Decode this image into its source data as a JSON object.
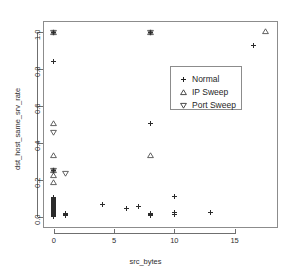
{
  "chart_data": {
    "type": "scatter",
    "title": "",
    "xlabel": "src_bytes",
    "ylabel": "dst_host_same_srv_rate",
    "xlim": [
      -0.9,
      18.6
    ],
    "ylim": [
      -0.06,
      1.06
    ],
    "xticks": [
      0,
      5,
      10,
      15
    ],
    "xticklabels": [
      "0",
      "5",
      "10",
      "15"
    ],
    "yticks": [
      0.0,
      0.2,
      0.4,
      0.6,
      0.8,
      1.0
    ],
    "yticklabels": [
      "0.0",
      "0.2",
      "0.4",
      "0.6",
      "0.8",
      "1.0"
    ],
    "grid": false,
    "legend_position": "center-right",
    "series": [
      {
        "name": "Normal",
        "marker": "plus",
        "color": "#2b2b2b",
        "points": [
          [
            0,
            1.0
          ],
          [
            0,
            1.0
          ],
          [
            0,
            1.0
          ],
          [
            0,
            0.84
          ],
          [
            0,
            0.25
          ],
          [
            0,
            0.25
          ],
          [
            0,
            0.105
          ],
          [
            0,
            0.1
          ],
          [
            0,
            0.095
          ],
          [
            0,
            0.09
          ],
          [
            0,
            0.088
          ],
          [
            0,
            0.085
          ],
          [
            0,
            0.082
          ],
          [
            0,
            0.08
          ],
          [
            0,
            0.078
          ],
          [
            0,
            0.075
          ],
          [
            0,
            0.072
          ],
          [
            0,
            0.07
          ],
          [
            0,
            0.068
          ],
          [
            0,
            0.065
          ],
          [
            0,
            0.062
          ],
          [
            0,
            0.06
          ],
          [
            0,
            0.058
          ],
          [
            0,
            0.055
          ],
          [
            0,
            0.052
          ],
          [
            0,
            0.05
          ],
          [
            0,
            0.048
          ],
          [
            0,
            0.045
          ],
          [
            0,
            0.042
          ],
          [
            0,
            0.04
          ],
          [
            0,
            0.038
          ],
          [
            0,
            0.035
          ],
          [
            0,
            0.032
          ],
          [
            0,
            0.03
          ],
          [
            0,
            0.028
          ],
          [
            0,
            0.025
          ],
          [
            0,
            0.022
          ],
          [
            0,
            0.02
          ],
          [
            0,
            0.018
          ],
          [
            0,
            0.015
          ],
          [
            0,
            0.012
          ],
          [
            0,
            0.01
          ],
          [
            0,
            0.008
          ],
          [
            0,
            0.005
          ],
          [
            0,
            0.003
          ],
          [
            0,
            0.0
          ],
          [
            1,
            0.02
          ],
          [
            1,
            0.015
          ],
          [
            1,
            0.012
          ],
          [
            1,
            0.01
          ],
          [
            1,
            0.008
          ],
          [
            1,
            0.005
          ],
          [
            4,
            0.065
          ],
          [
            6,
            0.045
          ],
          [
            7,
            0.055
          ],
          [
            8,
            1.0
          ],
          [
            8,
            1.0
          ],
          [
            8,
            0.505
          ],
          [
            8,
            0.02
          ],
          [
            8,
            0.015
          ],
          [
            8,
            0.012
          ],
          [
            8,
            0.01
          ],
          [
            8,
            0.008
          ],
          [
            10,
            0.11
          ],
          [
            10,
            0.025
          ],
          [
            10,
            0.015
          ],
          [
            13,
            0.025
          ],
          [
            16.6,
            0.93
          ]
        ]
      },
      {
        "name": "IP Sweep",
        "marker": "triangle-up",
        "color": "#3a3a3a",
        "points": [
          [
            0,
            1.0
          ],
          [
            0,
            0.505
          ],
          [
            0,
            0.335
          ],
          [
            0,
            0.25
          ],
          [
            0,
            0.225
          ],
          [
            0,
            0.185
          ],
          [
            8,
            1.0
          ],
          [
            8,
            0.335
          ],
          [
            17.6,
            1.005
          ]
        ]
      },
      {
        "name": "Port Sweep",
        "marker": "triangle-down",
        "color": "#3a3a3a",
        "points": [
          [
            0,
            1.0
          ],
          [
            0,
            0.455
          ],
          [
            0,
            0.25
          ],
          [
            1,
            0.235
          ],
          [
            8,
            1.0
          ]
        ]
      }
    ]
  },
  "legend": {
    "entries": [
      {
        "label": "Normal",
        "marker": "plus"
      },
      {
        "label": "IP Sweep",
        "marker": "triangle-up"
      },
      {
        "label": "Port Sweep",
        "marker": "triangle-down"
      }
    ]
  },
  "axes": {
    "x_title": "src_bytes",
    "y_title": "dst_host_same_srv_rate"
  }
}
